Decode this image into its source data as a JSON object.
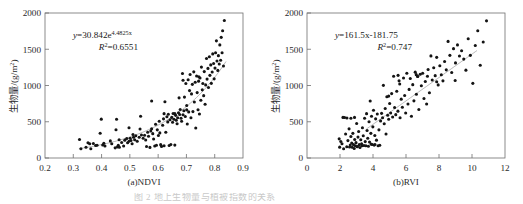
{
  "figure": {
    "background": "#ffffff",
    "point_color": "#141414",
    "axis_color": "#6f6f6f",
    "trend_color": "#9a9a9a",
    "bottom_caption_fragment": "图 2  地上生物量与植被指数的关系"
  },
  "chart_data": [
    {
      "type": "scatter",
      "panel_label": "(a)NDVI",
      "title": "",
      "xlabel": "(a)NDVI",
      "ylabel": "生物量/(g/m2)",
      "ylabel_base": "生物量/(g/m",
      "ylabel_sup": "2",
      "ylabel_tail": ")",
      "xlim": [
        0.2,
        0.9
      ],
      "ylim": [
        0,
        2000
      ],
      "xticks": [
        0.2,
        0.3,
        0.4,
        0.5,
        0.6,
        0.7,
        0.8,
        0.9
      ],
      "xtick_labels": [
        "0.2",
        "0.3",
        "0.4",
        "0.5",
        "0.6",
        "0.7",
        "0.8",
        "0.9"
      ],
      "yticks": [
        0,
        500,
        1000,
        1500,
        2000
      ],
      "ytick_labels": [
        "0",
        "500",
        "1000",
        "1500",
        "2000"
      ],
      "grid": false,
      "legend": "none",
      "annotations": {
        "equation_prefix": "y",
        "equation_body": "=30.842e",
        "equation_exponent": "4.4825x",
        "r2_symbol": "R",
        "r2_sup": "2",
        "r2_value": "=0.6551"
      },
      "fit": {
        "kind": "exponential",
        "a": 30.842,
        "b": 4.4825,
        "r2": 0.6551,
        "x_start": 0.32,
        "x_end": 0.84
      },
      "points": [
        [
          0.322,
          255
        ],
        [
          0.327,
          128
        ],
        [
          0.345,
          148
        ],
        [
          0.352,
          210
        ],
        [
          0.358,
          196
        ],
        [
          0.362,
          128
        ],
        [
          0.371,
          200
        ],
        [
          0.379,
          172
        ],
        [
          0.395,
          342
        ],
        [
          0.399,
          536
        ],
        [
          0.404,
          180
        ],
        [
          0.412,
          166
        ],
        [
          0.431,
          236
        ],
        [
          0.448,
          140
        ],
        [
          0.451,
          390
        ],
        [
          0.453,
          534
        ],
        [
          0.456,
          152
        ],
        [
          0.459,
          176
        ],
        [
          0.463,
          148
        ],
        [
          0.471,
          214
        ],
        [
          0.478,
          166
        ],
        [
          0.482,
          246
        ],
        [
          0.489,
          268
        ],
        [
          0.492,
          210
        ],
        [
          0.497,
          418
        ],
        [
          0.501,
          272
        ],
        [
          0.504,
          242
        ],
        [
          0.508,
          196
        ],
        [
          0.511,
          324
        ],
        [
          0.513,
          286
        ],
        [
          0.517,
          252
        ],
        [
          0.521,
          306
        ],
        [
          0.526,
          230
        ],
        [
          0.533,
          286
        ],
        [
          0.538,
          576
        ],
        [
          0.541,
          318
        ],
        [
          0.547,
          272
        ],
        [
          0.552,
          314
        ],
        [
          0.556,
          248
        ],
        [
          0.559,
          158
        ],
        [
          0.563,
          356
        ],
        [
          0.566,
          300
        ],
        [
          0.571,
          146
        ],
        [
          0.574,
          372
        ],
        [
          0.577,
          786
        ],
        [
          0.581,
          336
        ],
        [
          0.584,
          262
        ],
        [
          0.588,
          166
        ],
        [
          0.591,
          466
        ],
        [
          0.594,
          176
        ],
        [
          0.597,
          388
        ],
        [
          0.601,
          310
        ],
        [
          0.604,
          506
        ],
        [
          0.606,
          346
        ],
        [
          0.609,
          184
        ],
        [
          0.612,
          160
        ],
        [
          0.616,
          452
        ],
        [
          0.619,
          540
        ],
        [
          0.621,
          168
        ],
        [
          0.624,
          776
        ],
        [
          0.627,
          356
        ],
        [
          0.631,
          568
        ],
        [
          0.634,
          498
        ],
        [
          0.636,
          604
        ],
        [
          0.639,
          172
        ],
        [
          0.642,
          528
        ],
        [
          0.645,
          186
        ],
        [
          0.648,
          560
        ],
        [
          0.651,
          494
        ],
        [
          0.653,
          614
        ],
        [
          0.656,
          534
        ],
        [
          0.659,
          178
        ],
        [
          0.662,
          588
        ],
        [
          0.664,
          520
        ],
        [
          0.667,
          472
        ],
        [
          0.669,
          556
        ],
        [
          0.672,
          624
        ],
        [
          0.674,
          830
        ],
        [
          0.676,
          600
        ],
        [
          0.678,
          668
        ],
        [
          0.681,
          548
        ],
        [
          0.683,
          506
        ],
        [
          0.686,
          1166
        ],
        [
          0.688,
          596
        ],
        [
          0.691,
          652
        ],
        [
          0.693,
          840
        ],
        [
          0.696,
          572
        ],
        [
          0.698,
          1028
        ],
        [
          0.701,
          724
        ],
        [
          0.703,
          468
        ],
        [
          0.706,
          1080
        ],
        [
          0.708,
          636
        ],
        [
          0.711,
          930
        ],
        [
          0.713,
          1152
        ],
        [
          0.716,
          556
        ],
        [
          0.718,
          884
        ],
        [
          0.721,
          1016
        ],
        [
          0.723,
          640
        ],
        [
          0.726,
          1188
        ],
        [
          0.728,
          772
        ],
        [
          0.731,
          1044
        ],
        [
          0.733,
          414
        ],
        [
          0.736,
          1132
        ],
        [
          0.738,
          902
        ],
        [
          0.741,
          666
        ],
        [
          0.743,
          1060
        ],
        [
          0.746,
          606
        ],
        [
          0.748,
          1104
        ],
        [
          0.751,
          796
        ],
        [
          0.753,
          1254
        ],
        [
          0.756,
          940
        ],
        [
          0.758,
          1028
        ],
        [
          0.761,
          860
        ],
        [
          0.763,
          1192
        ],
        [
          0.766,
          742
        ],
        [
          0.768,
          1008
        ],
        [
          0.771,
          1372
        ],
        [
          0.773,
          1088
        ],
        [
          0.776,
          1236
        ],
        [
          0.778,
          972
        ],
        [
          0.781,
          1396
        ],
        [
          0.783,
          1140
        ],
        [
          0.786,
          1284
        ],
        [
          0.788,
          1030
        ],
        [
          0.791,
          1186
        ],
        [
          0.793,
          1436
        ],
        [
          0.796,
          1304
        ],
        [
          0.798,
          1092
        ],
        [
          0.801,
          1240
        ],
        [
          0.803,
          1452
        ],
        [
          0.806,
          1616
        ],
        [
          0.808,
          1338
        ],
        [
          0.811,
          1208
        ],
        [
          0.813,
          1412
        ],
        [
          0.816,
          1296
        ],
        [
          0.818,
          1560
        ],
        [
          0.821,
          1348
        ],
        [
          0.823,
          1664
        ],
        [
          0.826,
          1452
        ],
        [
          0.828,
          1756
        ],
        [
          0.831,
          1268
        ],
        [
          0.834,
          1896
        ],
        [
          0.659,
          612
        ],
        [
          0.701,
          664
        ],
        [
          0.744,
          1120
        ],
        [
          0.688,
          1072
        ],
        [
          0.621,
          612
        ],
        [
          0.577,
          404
        ],
        [
          0.536,
          400
        ],
        [
          0.497,
          232
        ],
        [
          0.462,
          252
        ],
        [
          0.436,
          196
        ],
        [
          0.408,
          202
        ],
        [
          0.384,
          176
        ]
      ]
    },
    {
      "type": "scatter",
      "panel_label": "(b)RVI",
      "title": "",
      "xlabel": "(b)RVI",
      "ylabel": "生物量/(g/m2)",
      "ylabel_base": "生物量/(g/m",
      "ylabel_sup": "2",
      "ylabel_tail": ")",
      "xlim": [
        0,
        12
      ],
      "ylim": [
        0,
        2000
      ],
      "xticks": [
        0,
        2,
        4,
        6,
        8,
        10,
        12
      ],
      "xtick_labels": [
        "0",
        "2",
        "4",
        "6",
        "8",
        "10",
        "12"
      ],
      "yticks": [
        0,
        500,
        1000,
        1500,
        2000
      ],
      "ytick_labels": [
        "0",
        "500",
        "1000",
        "1500",
        "2000"
      ],
      "grid": false,
      "legend": "none",
      "annotations": {
        "equation_prefix": "y",
        "equation_body": "=161.5x-181.75",
        "equation_exponent": "",
        "r2_symbol": "R",
        "r2_sup": "2",
        "r2_value": "=0.747"
      },
      "fit": {
        "kind": "linear",
        "slope": 161.5,
        "intercept": -181.75,
        "r2": 0.747,
        "x_start": 3.6,
        "x_end": 10.3
      },
      "points": [
        [
          1.95,
          264
        ],
        [
          1.98,
          150
        ],
        [
          2.05,
          228
        ],
        [
          2.12,
          196
        ],
        [
          2.18,
          560
        ],
        [
          2.22,
          128
        ],
        [
          2.28,
          558
        ],
        [
          2.34,
          330
        ],
        [
          2.41,
          156
        ],
        [
          2.48,
          240
        ],
        [
          2.55,
          402
        ],
        [
          2.58,
          152
        ],
        [
          2.62,
          178
        ],
        [
          2.66,
          296
        ],
        [
          2.71,
          206
        ],
        [
          2.74,
          148
        ],
        [
          2.78,
          340
        ],
        [
          2.82,
          184
        ],
        [
          2.86,
          132
        ],
        [
          2.89,
          256
        ],
        [
          2.93,
          168
        ],
        [
          2.97,
          212
        ],
        [
          3.01,
          476
        ],
        [
          3.05,
          158
        ],
        [
          3.09,
          288
        ],
        [
          3.13,
          366
        ],
        [
          3.17,
          184
        ],
        [
          3.21,
          144
        ],
        [
          3.26,
          252
        ],
        [
          3.31,
          196
        ],
        [
          3.36,
          418
        ],
        [
          3.41,
          306
        ],
        [
          3.45,
          172
        ],
        [
          3.49,
          548
        ],
        [
          3.53,
          226
        ],
        [
          3.57,
          170
        ],
        [
          3.61,
          612
        ],
        [
          3.64,
          380
        ],
        [
          3.68,
          272
        ],
        [
          3.72,
          162
        ],
        [
          3.76,
          500
        ],
        [
          3.79,
          220
        ],
        [
          3.83,
          786
        ],
        [
          3.87,
          340
        ],
        [
          3.91,
          576
        ],
        [
          3.95,
          186
        ],
        [
          3.99,
          430
        ],
        [
          4.03,
          658
        ],
        [
          4.07,
          178
        ],
        [
          4.11,
          310
        ],
        [
          4.16,
          540
        ],
        [
          4.21,
          246
        ],
        [
          4.26,
          606
        ],
        [
          4.31,
          168
        ],
        [
          4.36,
          388
        ],
        [
          4.41,
          176
        ],
        [
          4.46,
          512
        ],
        [
          4.52,
          616
        ],
        [
          4.58,
          556
        ],
        [
          4.63,
          1002
        ],
        [
          4.68,
          472
        ],
        [
          4.74,
          682
        ],
        [
          4.79,
          330
        ],
        [
          4.84,
          844
        ],
        [
          4.89,
          590
        ],
        [
          4.95,
          534
        ],
        [
          5.01,
          752
        ],
        [
          5.07,
          620
        ],
        [
          5.13,
          888
        ],
        [
          5.19,
          566
        ],
        [
          5.25,
          1128
        ],
        [
          5.31,
          696
        ],
        [
          5.38,
          598
        ],
        [
          5.44,
          920
        ],
        [
          5.51,
          646
        ],
        [
          5.58,
          1064
        ],
        [
          5.64,
          556
        ],
        [
          5.71,
          812
        ],
        [
          5.78,
          700
        ],
        [
          5.85,
          1104
        ],
        [
          5.92,
          862
        ],
        [
          5.98,
          620
        ],
        [
          6.05,
          1168
        ],
        [
          6.12,
          744
        ],
        [
          6.19,
          946
        ],
        [
          6.26,
          1096
        ],
        [
          6.33,
          576
        ],
        [
          6.41,
          1012
        ],
        [
          6.48,
          788
        ],
        [
          6.56,
          1184
        ],
        [
          6.63,
          880
        ],
        [
          6.71,
          1124
        ],
        [
          6.78,
          668
        ],
        [
          6.86,
          1156
        ],
        [
          6.93,
          996
        ],
        [
          7.01,
          1168
        ],
        [
          7.09,
          820
        ],
        [
          7.17,
          1056
        ],
        [
          7.25,
          744
        ],
        [
          7.34,
          1220
        ],
        [
          7.42,
          900
        ],
        [
          7.51,
          1408
        ],
        [
          7.59,
          1076
        ],
        [
          7.68,
          1244
        ],
        [
          7.77,
          1136
        ],
        [
          7.86,
          1388
        ],
        [
          7.95,
          1008
        ],
        [
          8.05,
          1272
        ],
        [
          8.14,
          1148
        ],
        [
          8.24,
          1064
        ],
        [
          8.34,
          1332
        ],
        [
          8.44,
          1216
        ],
        [
          8.55,
          1608
        ],
        [
          8.66,
          1416
        ],
        [
          8.77,
          1180
        ],
        [
          8.88,
          1508
        ],
        [
          9.0,
          1312
        ],
        [
          9.12,
          1560
        ],
        [
          9.24,
          1406
        ],
        [
          9.37,
          1480
        ],
        [
          9.5,
          1364
        ],
        [
          9.63,
          1212
        ],
        [
          9.77,
          1644
        ],
        [
          9.9,
          1416
        ],
        [
          10.05,
          1030
        ],
        [
          10.2,
          1552
        ],
        [
          10.35,
          1756
        ],
        [
          10.5,
          1280
        ],
        [
          10.68,
          1600
        ],
        [
          10.88,
          1892
        ],
        [
          2.42,
          552
        ],
        [
          2.66,
          548
        ],
        [
          3.88,
          192
        ],
        [
          4.12,
          186
        ],
        [
          3.33,
          168
        ],
        [
          3.04,
          156
        ],
        [
          2.88,
          560
        ],
        [
          5.52,
          1140
        ],
        [
          6.62,
          1150
        ],
        [
          6.7,
          1126
        ],
        [
          4.95,
          854
        ],
        [
          5.62,
          1020
        ],
        [
          7.3,
          1128
        ],
        [
          7.86,
          1052
        ],
        [
          8.98,
          1068
        ]
      ]
    }
  ]
}
